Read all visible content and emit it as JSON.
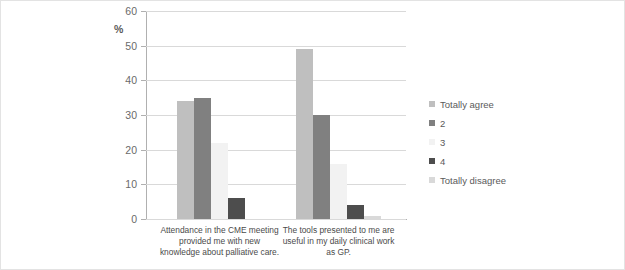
{
  "chart_data": {
    "type": "bar",
    "title": "",
    "subtitle": "",
    "xlabel": "",
    "ylabel": "%",
    "ylim": [
      0,
      60
    ],
    "ytick_labels": [
      "60",
      "50",
      "40",
      "30",
      "20",
      "10",
      "0"
    ],
    "ytick_values": [
      60,
      50,
      40,
      30,
      20,
      10,
      0
    ],
    "grid": true,
    "legend_position": "right",
    "categories": [
      "Attendance in the CME meeting provided me with new knowledge about palliative care.",
      "The tools presented to me are useful in my daily clinical work as GP."
    ],
    "series": [
      {
        "name": "Totally agree",
        "color": "#bfbfbf",
        "values": [
          34,
          49
        ]
      },
      {
        "name": "2",
        "color": "#808080",
        "values": [
          35,
          30
        ]
      },
      {
        "name": "3",
        "color": "#f2f2f2",
        "values": [
          22,
          16
        ]
      },
      {
        "name": "4",
        "color": "#4d4d4d",
        "values": [
          6,
          4
        ]
      },
      {
        "name": "Totally disagree",
        "color": "#d9d9d9",
        "values": [
          0,
          1
        ]
      }
    ]
  },
  "legend": {
    "items": [
      {
        "label": "Totally agree"
      },
      {
        "label": "2"
      },
      {
        "label": "3"
      },
      {
        "label": "4"
      },
      {
        "label": "Totally disagree"
      }
    ]
  }
}
